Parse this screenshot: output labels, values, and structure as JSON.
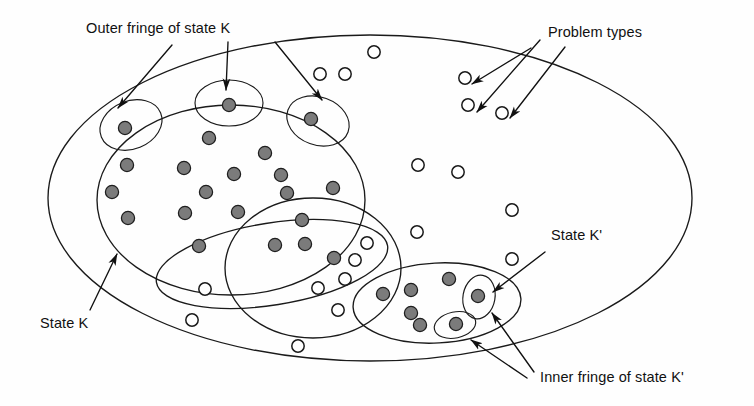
{
  "figure": {
    "kind": "venn-style set diagram",
    "background_color": "#fefefe",
    "line_color": "#1a1a1a",
    "filled_dot_color": "#7b7b7b",
    "open_dot_color": "#ffffff",
    "labels": {
      "outer_fringe_k": "Outer fringe of state K",
      "problem_types": "Problem types",
      "state_k": "State K",
      "state_k_prime": "State K'",
      "inner_fringe_k_prime": "Inner fringe of state K'"
    },
    "label_positions": {
      "outer_fringe_k": {
        "x": 86,
        "y": 33
      },
      "problem_types": {
        "x": 548,
        "y": 37
      },
      "state_k": {
        "x": 40,
        "y": 328
      },
      "state_k_prime": {
        "x": 551,
        "y": 240
      },
      "inner_fringe_k_prime": {
        "x": 540,
        "y": 382
      }
    },
    "regions": [
      {
        "name": "universe-ellipse",
        "cx": 370,
        "cy": 198,
        "rx": 322,
        "ry": 163,
        "rotate": 0
      },
      {
        "name": "state-k-ellipse",
        "cx": 231,
        "cy": 200,
        "rx": 134,
        "ry": 95,
        "rotate": 0
      },
      {
        "name": "middle-flat-ellipse",
        "cx": 272,
        "cy": 264,
        "rx": 117,
        "ry": 41,
        "rotate": -9
      },
      {
        "name": "middle-circle",
        "cx": 313,
        "cy": 268,
        "rx": 88,
        "ry": 70,
        "rotate": 0
      },
      {
        "name": "state-k-prime-ellipse",
        "cx": 437,
        "cy": 303,
        "rx": 84,
        "ry": 40,
        "rotate": -3
      }
    ],
    "outer_fringe_bumps": [
      {
        "cx": 131,
        "cy": 125,
        "rx": 32,
        "ry": 24,
        "rotate": -22
      },
      {
        "cx": 229,
        "cy": 103,
        "rx": 34,
        "ry": 23,
        "rotate": 0
      },
      {
        "cx": 318,
        "cy": 121,
        "rx": 32,
        "ry": 24,
        "rotate": 20
      }
    ],
    "inner_fringe_bumps": [
      {
        "cx": 479,
        "cy": 297,
        "rx": 16,
        "ry": 22,
        "rotate": 10
      },
      {
        "cx": 455,
        "cy": 325,
        "rx": 21,
        "ry": 13,
        "rotate": -12
      }
    ],
    "filled_dots": [
      {
        "cx": 125,
        "cy": 128
      },
      {
        "cx": 229,
        "cy": 105
      },
      {
        "cx": 311,
        "cy": 119
      },
      {
        "cx": 209,
        "cy": 138
      },
      {
        "cx": 127,
        "cy": 165
      },
      {
        "cx": 265,
        "cy": 153
      },
      {
        "cx": 184,
        "cy": 168
      },
      {
        "cx": 234,
        "cy": 174
      },
      {
        "cx": 281,
        "cy": 175
      },
      {
        "cx": 112,
        "cy": 192
      },
      {
        "cx": 206,
        "cy": 192
      },
      {
        "cx": 287,
        "cy": 193
      },
      {
        "cx": 333,
        "cy": 188
      },
      {
        "cx": 128,
        "cy": 218
      },
      {
        "cx": 185,
        "cy": 213
      },
      {
        "cx": 238,
        "cy": 212
      },
      {
        "cx": 302,
        "cy": 220
      },
      {
        "cx": 305,
        "cy": 244
      },
      {
        "cx": 199,
        "cy": 246
      },
      {
        "cx": 275,
        "cy": 245
      },
      {
        "cx": 334,
        "cy": 258
      },
      {
        "cx": 383,
        "cy": 294
      },
      {
        "cx": 411,
        "cy": 290
      },
      {
        "cx": 411,
        "cy": 313
      },
      {
        "cx": 420,
        "cy": 325
      },
      {
        "cx": 449,
        "cy": 279
      },
      {
        "cx": 478,
        "cy": 296
      },
      {
        "cx": 456,
        "cy": 324
      }
    ],
    "open_dots": [
      {
        "cx": 374,
        "cy": 52
      },
      {
        "cx": 320,
        "cy": 74
      },
      {
        "cx": 345,
        "cy": 74
      },
      {
        "cx": 465,
        "cy": 78
      },
      {
        "cx": 468,
        "cy": 105
      },
      {
        "cx": 502,
        "cy": 113
      },
      {
        "cx": 418,
        "cy": 165
      },
      {
        "cx": 458,
        "cy": 172
      },
      {
        "cx": 512,
        "cy": 210
      },
      {
        "cx": 417,
        "cy": 232
      },
      {
        "cx": 367,
        "cy": 243
      },
      {
        "cx": 355,
        "cy": 260
      },
      {
        "cx": 345,
        "cy": 279
      },
      {
        "cx": 318,
        "cy": 288
      },
      {
        "cx": 205,
        "cy": 289
      },
      {
        "cx": 338,
        "cy": 310
      },
      {
        "cx": 192,
        "cy": 320
      },
      {
        "cx": 298,
        "cy": 346
      },
      {
        "cx": 512,
        "cy": 259
      }
    ],
    "leaders": {
      "outer_fringe_k": [
        {
          "from": [
            172,
            45
          ],
          "to": [
            118,
            108
          ]
        },
        {
          "from": [
            228,
            42
          ],
          "to": [
            226,
            90
          ]
        },
        {
          "from": [
            275,
            42
          ],
          "to": [
            322,
            100
          ]
        }
      ],
      "problem_types": [
        {
          "from": [
            531,
            48
          ],
          "to": [
            472,
            84
          ]
        },
        {
          "from": [
            540,
            40
          ],
          "to": [
            477,
            112
          ]
        },
        {
          "from": [
            565,
            47
          ],
          "to": [
            510,
            118
          ]
        }
      ],
      "state_k": [
        {
          "from": [
            90,
            310
          ],
          "to": [
            117,
            254
          ]
        }
      ],
      "state_k_prime": [
        {
          "from": [
            545,
            252
          ],
          "to": [
            493,
            292
          ]
        }
      ],
      "inner_fringe_k_prime": [
        {
          "from": [
            534,
            372
          ],
          "to": [
            492,
            313
          ]
        },
        {
          "from": [
            527,
            378
          ],
          "to": [
            471,
            340
          ]
        }
      ]
    }
  }
}
